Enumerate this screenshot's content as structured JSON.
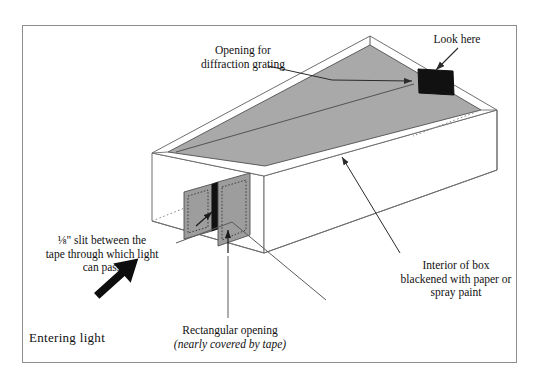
{
  "figure": {
    "kind": "technical-line-diagram",
    "frame_color": "#8d8d8d",
    "background": "#ffffff"
  },
  "colors": {
    "interior_gray": "#a9a9a9",
    "tape_gray": "#9d9d9d",
    "opening_black": "#111111",
    "line": "#5a5a5a",
    "text": "#111111"
  },
  "labels": {
    "grating": {
      "line1": "Opening for",
      "line2": "diffraction grating"
    },
    "look_here": "Look here",
    "slit": {
      "line1": "⅛\" slit between the",
      "line2": "tape through which light",
      "line3": "can pass"
    },
    "interior": {
      "line1": "Interior of box",
      "line2": "blackened with paper or",
      "line3": "spray paint"
    },
    "rectangular": {
      "line1": "Rectangular opening",
      "line2": "(nearly covered by tape)"
    },
    "entering_light": "Entering light"
  },
  "icons": {
    "entering_light_arrow": "thick-arrow-up-right-icon",
    "look_here_arrow": "arrow-down-left-icon",
    "grating_arrow": "arrow-right-icon",
    "interior_arrow": "arrow-up-left-icon",
    "slit_arrow": "arrow-up-right-small-icon",
    "tape_arrow": "arrow-up-small-icon"
  },
  "box_parts": {
    "interior_floor": "blackened interior floor",
    "far_wall": "far interior wall",
    "grating_opening": "diffraction grating opening",
    "front_panel": "front panel with slit",
    "tape_left": "tape piece left",
    "tape_right": "tape piece right",
    "slit": "one-eighth inch slit"
  }
}
